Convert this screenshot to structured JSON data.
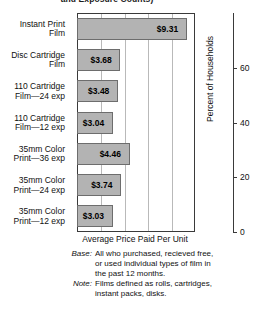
{
  "title_clipped": "and Exposure Counts)",
  "chart_data": {
    "type": "bar",
    "orientation": "horizontal",
    "title": "and Exposure Counts)",
    "categories": [
      "Instant Print\nFilm",
      "Disc Cartridge\nFilm",
      "110 Cartridge\nFilm—24 exp",
      "110 Cartridge\nFilm—12 exp",
      "35mm Color\nPrint—36 exp",
      "35mm Color\nPrint—24 exp",
      "35mm Color\nPrint—12 exp"
    ],
    "values": [
      9.31,
      3.68,
      3.48,
      3.04,
      4.46,
      3.74,
      3.03
    ],
    "value_labels": [
      "$9.31",
      "$3.68",
      "$3.48",
      "$3.04",
      "$4.46",
      "$3.74",
      "$3.03"
    ],
    "xlabel": "Average Price Paid Per Unit",
    "xlim": [
      0,
      10
    ],
    "ylabel_right": "Percent of Households",
    "right_axis_ticks": [
      "60",
      "40",
      "20",
      "0"
    ],
    "right_axis_values": [
      60,
      40,
      20,
      0
    ],
    "right_axis_lim": [
      0,
      80
    ],
    "grid": true,
    "gridline_count": 4,
    "legend": "none",
    "bar_color": "#b3b3b3",
    "bar_edge_color": "#6d6d6d",
    "axis_color": "#3a3a3a",
    "grid_color": "#b9b9b9"
  },
  "axes": {
    "x_title": "Average Price Paid Per Unit",
    "right_title": "Percent of Households"
  },
  "footnotes": [
    {
      "key": "Base:",
      "text": "All who purchased, recieved free,\nor used individual types of film in\nthe past 12 months."
    },
    {
      "key": "Note:",
      "text": "Films defined as rolls, cartridges,\ninstant packs, disks."
    }
  ]
}
